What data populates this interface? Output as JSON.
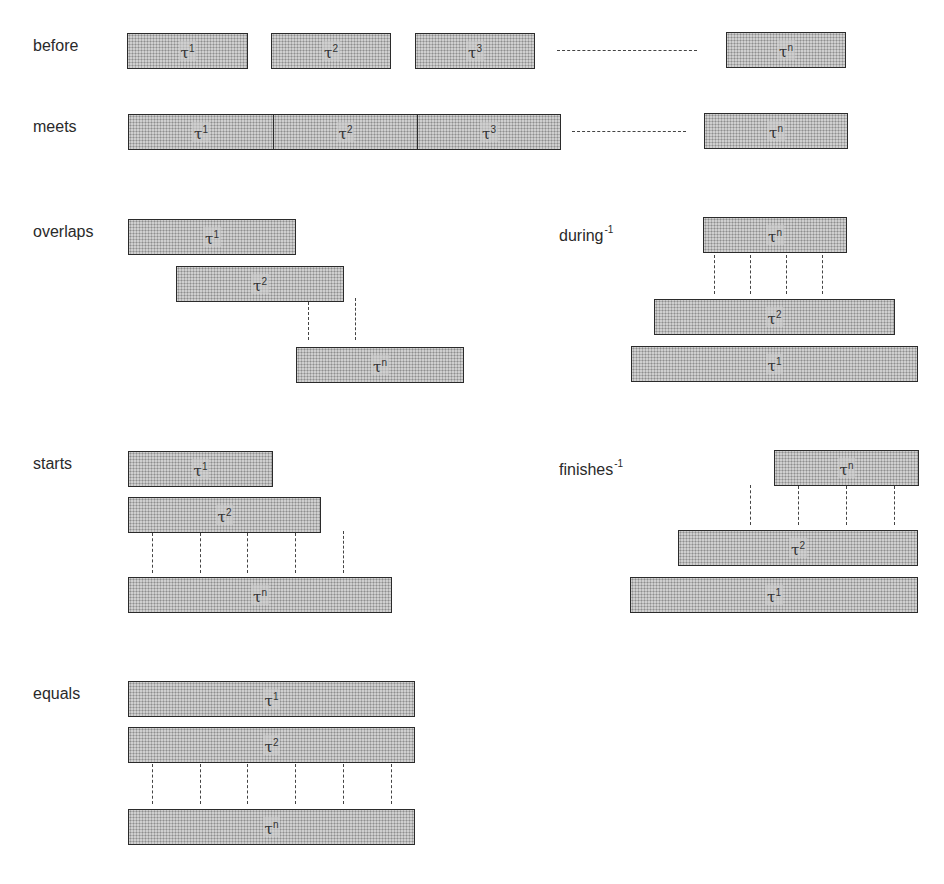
{
  "figure": {
    "type": "temporal-relations-diagram",
    "fill_pattern": "halftone-dots",
    "colors": {
      "bar_fill": "#cfcfcf",
      "bar_border": "#2b2b2b",
      "dash": "#444444",
      "text": "#2a2a2a"
    },
    "interval_symbol": "τ"
  },
  "relations": {
    "before": {
      "label": "before",
      "sup": "",
      "bars": [
        {
          "base": "τ",
          "index": "1"
        },
        {
          "base": "τ",
          "index": "2"
        },
        {
          "base": "τ",
          "index": "3"
        },
        {
          "base": "τ",
          "index": "n"
        }
      ],
      "ellipsis": "dashed-gap"
    },
    "meets": {
      "label": "meets",
      "sup": "",
      "bars": [
        {
          "base": "τ",
          "index": "1"
        },
        {
          "base": "τ",
          "index": "2"
        },
        {
          "base": "τ",
          "index": "3"
        },
        {
          "base": "τ",
          "index": "n"
        }
      ],
      "ellipsis": "dashed-gap"
    },
    "overlaps": {
      "label": "overlaps",
      "sup": "",
      "bars": [
        {
          "base": "τ",
          "index": "1"
        },
        {
          "base": "τ",
          "index": "2"
        },
        {
          "base": "τ",
          "index": "n"
        }
      ]
    },
    "during_inv": {
      "label": "during",
      "sup": "-1",
      "bars": [
        {
          "base": "τ",
          "index": "n"
        },
        {
          "base": "τ",
          "index": "2"
        },
        {
          "base": "τ",
          "index": "1"
        }
      ]
    },
    "starts": {
      "label": "starts",
      "sup": "",
      "bars": [
        {
          "base": "τ",
          "index": "1"
        },
        {
          "base": "τ",
          "index": "2"
        },
        {
          "base": "τ",
          "index": "n"
        }
      ]
    },
    "finishes_inv": {
      "label": "finishes",
      "sup": "-1",
      "bars": [
        {
          "base": "τ",
          "index": "n"
        },
        {
          "base": "τ",
          "index": "2"
        },
        {
          "base": "τ",
          "index": "1"
        }
      ]
    },
    "equals": {
      "label": "equals",
      "sup": "",
      "bars": [
        {
          "base": "τ",
          "index": "1"
        },
        {
          "base": "τ",
          "index": "2"
        },
        {
          "base": "τ",
          "index": "n"
        }
      ]
    }
  }
}
